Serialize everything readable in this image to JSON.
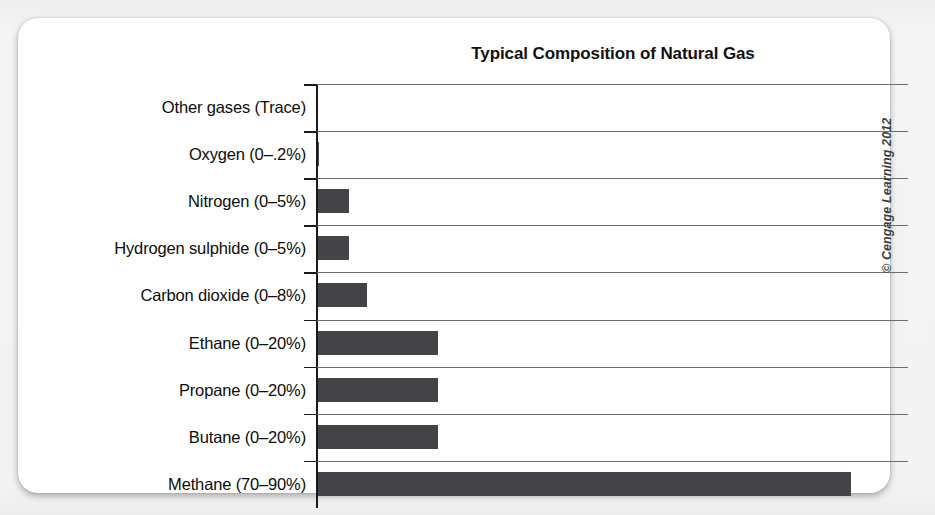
{
  "chart_data": {
    "type": "bar",
    "orientation": "horizontal",
    "title": "Typical Composition of Natural Gas",
    "xlabel": "",
    "ylabel": "",
    "categories": [
      "Other gases (Trace)",
      "Oxygen (0–.2%)",
      "Nitrogen (0–5%)",
      "Hydrogen sulphide (0–5%)",
      "Carbon dioxide (0–8%)",
      "Ethane (0–20%)",
      "Propane (0–20%)",
      "Butane (0–20%)",
      "Methane (70–90%)"
    ],
    "values": [
      0,
      0.2,
      5,
      5,
      8,
      20,
      20,
      20,
      90
    ],
    "bar_pixel_lengths": [
      0,
      1,
      31,
      31,
      49,
      120,
      120,
      120,
      533
    ],
    "xlim": [
      0,
      100
    ],
    "grid": true,
    "grid_axis": "y",
    "legend": false,
    "axis_ticks_visible": true,
    "value_labels_visible": false
  },
  "figure": {
    "credit": "© Cengage Learning 2012"
  },
  "colors": {
    "bar": "#444448",
    "axis": "#1a1a1a",
    "gridline": "#6d6d6d",
    "card": "#ffffff",
    "page_background": "#f2f2f2",
    "text": "#0d0d0d"
  }
}
